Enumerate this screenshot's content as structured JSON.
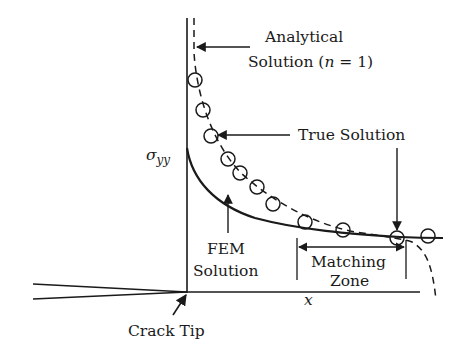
{
  "diagram": {
    "title": "",
    "labels": {
      "analytical_line1": "Analytical",
      "analytical_line2_prefix": "Solution (",
      "analytical_n": "n",
      "analytical_line2_suffix": " = 1)",
      "true_solution": "True Solution",
      "fem_line1": "FEM",
      "fem_line2": "Solution",
      "matching_line1": "Matching",
      "matching_line2": "Zone",
      "sigma": "σ",
      "sigma_sub": "yy",
      "x_axis": "x",
      "crack_tip": "Crack Tip"
    },
    "series": [
      {
        "name": "Analytical Solution (n = 1)",
        "style": "dashed"
      },
      {
        "name": "FEM Solution",
        "style": "solid"
      },
      {
        "name": "True Solution",
        "style": "circles"
      }
    ],
    "colors": {
      "ink": "#1a1a1a",
      "background": "#ffffff"
    }
  }
}
